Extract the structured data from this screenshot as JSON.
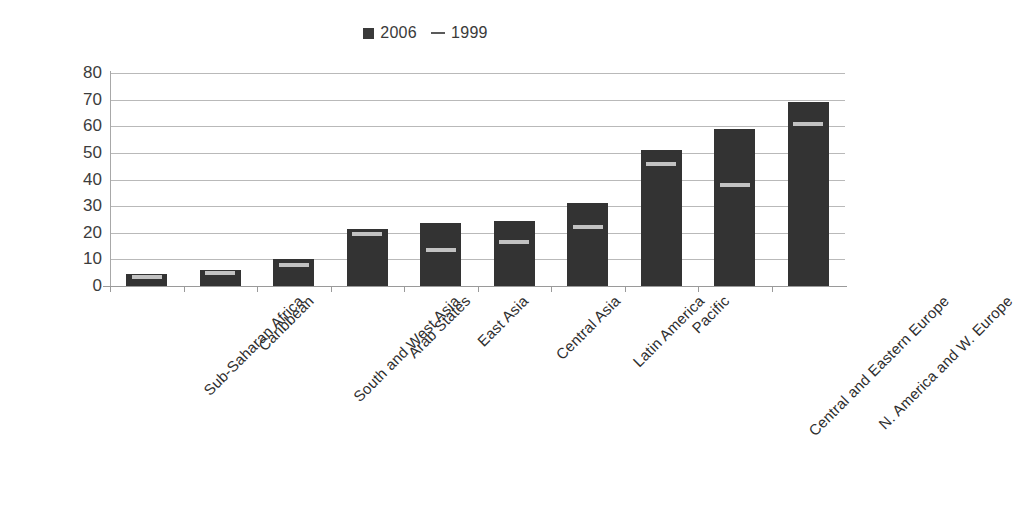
{
  "legend": {
    "position": "top-center",
    "entries": [
      {
        "label": "2006",
        "marker": "filled-square",
        "color": "#333333"
      },
      {
        "label": "1999",
        "marker": "dash",
        "color": "#5a5a5a"
      }
    ]
  },
  "axis": {
    "y_ticks": [
      "80",
      "70",
      "60",
      "50",
      "40",
      "30",
      "20",
      "10",
      "0"
    ]
  },
  "colors": {
    "bar": "#333333",
    "marker_1999": "#c2c2c2",
    "gridline": "#b9b9b9",
    "axis": "#9a9a9a",
    "text": "#2e2e2e"
  },
  "chart_data": {
    "type": "bar",
    "title": "",
    "subtitle": "",
    "xlabel": "",
    "ylabel": "",
    "ylim": [
      0,
      80
    ],
    "ytick_step": 10,
    "grid": true,
    "legend_position": "top-center",
    "categories": [
      "Sub-Saharan Africa",
      "Caribbean",
      "South and West Asia",
      "Arab States",
      "East Asia",
      "Central Asia",
      "Latin America",
      "Pacific",
      "Central and Eastern Europe",
      "N. America and W. Europe"
    ],
    "series": [
      {
        "name": "2006",
        "type": "bar",
        "values": [
          4.5,
          6,
          10,
          21.5,
          23.5,
          24.5,
          31,
          51,
          59,
          69
        ]
      },
      {
        "name": "1999",
        "type": "marker",
        "values": [
          3.5,
          5,
          8,
          19.5,
          13.5,
          16.5,
          22,
          46,
          38,
          61
        ]
      }
    ]
  }
}
